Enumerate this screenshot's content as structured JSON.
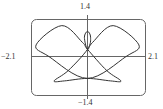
{
  "chart_data": {
    "type": "line",
    "title": "",
    "subtitle": "",
    "xlabel": "",
    "ylabel": "",
    "xlim": [
      -2.1,
      2.1
    ],
    "ylim": [
      -1.4,
      1.4
    ],
    "grid": false,
    "legend": null,
    "tick_labels": {
      "x_min": "−2.1",
      "x_max": "2.1",
      "y_min": "−1.4",
      "y_max": "1.4"
    },
    "series": [
      {
        "name": "curve",
        "color": "#333333",
        "points_approx": [
          {
            "x": 0.0,
            "y": 0.28
          },
          {
            "x": -0.12,
            "y": 0.75
          },
          {
            "x": 0.0,
            "y": 0.98
          },
          {
            "x": 0.12,
            "y": 0.75
          },
          {
            "x": 0.0,
            "y": 0.28
          },
          {
            "x": -0.75,
            "y": -0.55
          },
          {
            "x": -1.3,
            "y": -0.95
          },
          {
            "x": -0.9,
            "y": -0.95
          },
          {
            "x": 0.0,
            "y": -0.85
          },
          {
            "x": 0.9,
            "y": -0.95
          },
          {
            "x": 1.3,
            "y": -0.95
          },
          {
            "x": 0.75,
            "y": -0.55
          },
          {
            "x": 0.0,
            "y": 0.28
          },
          {
            "x": -0.2,
            "y": 0.55
          },
          {
            "x": -1.0,
            "y": 1.2
          },
          {
            "x": -2.0,
            "y": 0.45
          },
          {
            "x": -1.5,
            "y": 0.0
          },
          {
            "x": 0.0,
            "y": -0.85
          },
          {
            "x": 1.5,
            "y": 0.0
          },
          {
            "x": 2.0,
            "y": 0.45
          },
          {
            "x": 1.0,
            "y": 1.2
          },
          {
            "x": 0.2,
            "y": 0.55
          },
          {
            "x": 0.0,
            "y": 0.28
          }
        ]
      }
    ]
  },
  "labels": {
    "y_top": "1.4",
    "y_bottom": "−1.4",
    "x_left": "−2.1",
    "x_right": "2.1"
  }
}
